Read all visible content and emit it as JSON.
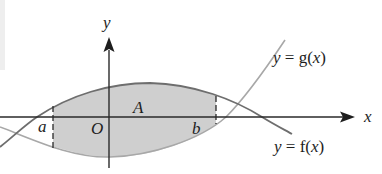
{
  "figure": {
    "type": "area between two curves",
    "axes": {
      "x_label": "x",
      "y_label": "y",
      "origin_label": "O"
    },
    "curves": [
      {
        "id": "g",
        "label_prefix": "y = ",
        "label_func": "g",
        "label_arg": "(x)",
        "color": "#a8a8a8"
      },
      {
        "id": "f",
        "label_prefix": "y = ",
        "label_func": "f",
        "label_arg": "(x)",
        "color": "#6e6e6e"
      }
    ],
    "bounds": {
      "left": "a",
      "right": "b"
    },
    "region_label": "A",
    "shade_color": "#cfcfcf",
    "axis_color": "#2a2a2a"
  }
}
